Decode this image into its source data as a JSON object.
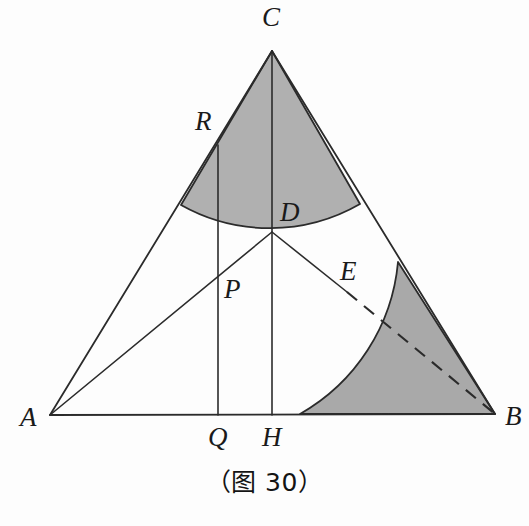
{
  "figure": {
    "caption": "（图 30）",
    "caption_position": {
      "x": 0,
      "y": 462
    },
    "canvas": {
      "width": 529,
      "height": 526
    },
    "background_color": "#fdfdfd",
    "stroke_color": "#2b2b2b",
    "shade_color": "#b0b0b0",
    "shade_color_secondary": "#a9a9a9",
    "stroke_width": 1.8
  },
  "points": {
    "A": {
      "x": 50,
      "y": 415,
      "label": "A",
      "label_x": 20,
      "label_y": 404
    },
    "B": {
      "x": 495,
      "y": 414,
      "label": "B",
      "label_x": 505,
      "label_y": 403
    },
    "C": {
      "x": 272,
      "y": 51,
      "label": "C",
      "label_x": 262,
      "label_y": 4
    },
    "D": {
      "x": 272,
      "y": 232,
      "label": "D",
      "label_x": 280,
      "label_y": 199
    },
    "E": {
      "x": 347,
      "y": 292,
      "label": "E",
      "label_x": 340,
      "label_y": 258
    },
    "H": {
      "x": 272,
      "y": 415,
      "label": "H",
      "label_x": 262,
      "label_y": 424
    },
    "Q": {
      "x": 218,
      "y": 415,
      "label": "Q",
      "label_x": 208,
      "label_y": 424
    },
    "R": {
      "x": 218,
      "y": 145,
      "label": "R",
      "label_x": 195,
      "label_y": 108
    },
    "P": {
      "x": 218,
      "y": 291,
      "label": "P",
      "label_x": 224,
      "label_y": 276
    }
  },
  "segments": [
    {
      "name": "side-AC",
      "from": "A",
      "to": "C",
      "style": "solid"
    },
    {
      "name": "side-CB",
      "from": "C",
      "to": "B",
      "style": "solid"
    },
    {
      "name": "side-AB",
      "from": "A",
      "to": "B",
      "style": "solid"
    },
    {
      "name": "cevian-AD",
      "from": "A",
      "to": "D",
      "style": "solid"
    },
    {
      "name": "altitude-CH",
      "from": "C",
      "to": "H",
      "style": "solid"
    },
    {
      "name": "vertical-RQ",
      "from": "R",
      "to": "Q",
      "style": "solid"
    },
    {
      "name": "segment-DE",
      "from": "D",
      "to": "E",
      "style": "solid"
    },
    {
      "name": "segment-EB",
      "from": "E",
      "to": "B",
      "style": "dashed"
    }
  ],
  "sectors": [
    {
      "name": "sector-at-C",
      "center": "C",
      "radius": 181,
      "arc_start": {
        "x": 181,
        "y": 205
      },
      "arc_end": {
        "x": 360,
        "y": 204
      },
      "through": "D",
      "fill": "#b0b0b0"
    },
    {
      "name": "sector-at-B",
      "center": "B",
      "radius": 195,
      "arc_start": {
        "x": 300,
        "y": 414
      },
      "arc_end": {
        "x": 398,
        "y": 262
      },
      "through": "E",
      "fill": "#a9a9a9"
    }
  ]
}
